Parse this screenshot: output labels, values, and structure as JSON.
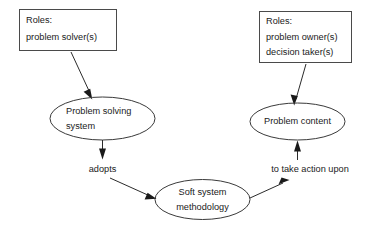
{
  "diagram": {
    "background_color": "#ffffff",
    "stroke_color": "#2b2b2b",
    "text_color": "#1a1a1a",
    "boxes": [
      {
        "id": "roles-problem-solver",
        "line1": "Roles:",
        "line2": "problem solver(s)",
        "line3": ""
      },
      {
        "id": "roles-problem-owner",
        "line1": "Roles:",
        "line2": "problem owner(s)",
        "line3": "decision taker(s)"
      }
    ],
    "ellipses": [
      {
        "id": "problem-solving-system",
        "line1": "Problem solving",
        "line2": "system"
      },
      {
        "id": "problem-content",
        "line1": "Problem content",
        "line2": ""
      },
      {
        "id": "soft-system-methodology",
        "line1": "Soft system",
        "line2": "methodology"
      }
    ],
    "edge_labels": [
      {
        "id": "adopts",
        "text": "adopts"
      },
      {
        "id": "to-take-action-upon",
        "text": "to take action upon"
      }
    ]
  }
}
